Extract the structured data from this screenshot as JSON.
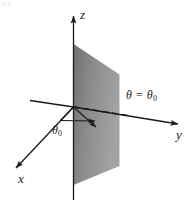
{
  "figure": {
    "tag": "(c)",
    "description_type": "3d-coordinate-diagram",
    "background_color": "#ffffff",
    "line_color": "#1a1a1a"
  },
  "axes": {
    "z": {
      "label": "z",
      "direction": "up"
    },
    "y": {
      "label": "y",
      "direction": "right"
    },
    "x": {
      "label": "x",
      "direction": "down-left"
    }
  },
  "plane": {
    "equation_symbol": "θ",
    "equation_operator": "=",
    "equation_value": "θ",
    "equation_subscript": "0",
    "fill_color_light": "#9b9b9b",
    "fill_color_dark": "#6f6f6f"
  },
  "angle": {
    "symbol": "θ",
    "subscript": "0"
  }
}
